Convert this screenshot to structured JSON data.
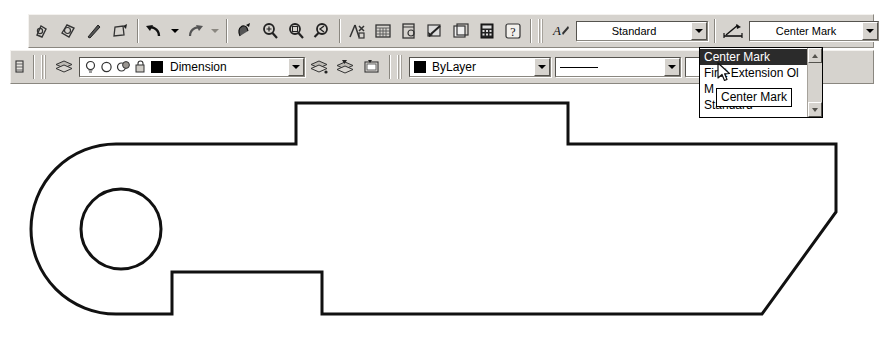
{
  "app": {
    "context": "AutoCAD drawing window with toolbars"
  },
  "toolbar_row_1": {
    "buttons": [
      {
        "name": "match-properties-icon",
        "label": "Match Properties"
      },
      {
        "name": "block-icon",
        "label": "Make Block"
      },
      {
        "name": "point-icon",
        "label": "Point"
      },
      {
        "name": "hatch-icon",
        "label": "Hatch"
      },
      {
        "name": "undo-icon",
        "label": "Undo"
      },
      {
        "name": "undo-dropdown-icon",
        "label": "Undo options"
      },
      {
        "name": "redo-icon",
        "label": "Redo"
      },
      {
        "name": "redo-dropdown-icon",
        "label": "Redo options"
      },
      {
        "name": "pan-realtime-icon",
        "label": "Pan Realtime"
      },
      {
        "name": "zoom-realtime-icon",
        "label": "Zoom Realtime"
      },
      {
        "name": "zoom-window-icon",
        "label": "Zoom Window"
      },
      {
        "name": "zoom-previous-icon",
        "label": "Zoom Previous"
      },
      {
        "name": "properties-icon",
        "label": "Properties"
      },
      {
        "name": "designcenter-icon",
        "label": "DesignCenter"
      },
      {
        "name": "tool-palettes-icon",
        "label": "Tool Palettes"
      },
      {
        "name": "sheet-set-icon",
        "label": "Sheet Set Manager"
      },
      {
        "name": "markup-set-icon",
        "label": "Markup Set Manager"
      },
      {
        "name": "calculator-icon",
        "label": "QuickCalc"
      },
      {
        "name": "help-icon",
        "label": "Help"
      }
    ],
    "text_style": {
      "icon_name": "text-style-icon",
      "value": "Standard"
    },
    "dim_style": {
      "icon_name": "dimension-style-icon",
      "value": "Center Mark"
    },
    "dim_style_manager": {
      "icon_name": "dimension-style-manager-icon",
      "label": "Dimension Style Manager"
    }
  },
  "toolbar_row_2": {
    "buttons_left": [
      {
        "name": "layer-properties-manager-icon",
        "label": "Layer Properties Manager"
      },
      {
        "name": "layer-previous-icon",
        "label": "Layer Previous"
      }
    ],
    "layer_combo": {
      "icons": [
        {
          "name": "layer-on-off-bulb-icon",
          "label": "On / Off"
        },
        {
          "name": "layer-freeze-thaw-icon",
          "label": "Freeze / Thaw"
        },
        {
          "name": "layer-freeze-viewport-icon",
          "label": "Freeze in viewport"
        },
        {
          "name": "layer-lock-unlock-icon",
          "label": "Lock / Unlock"
        },
        {
          "name": "layer-color-swatch-icon",
          "label": "Layer color"
        }
      ],
      "value": "Dimension"
    },
    "buttons_mid": [
      {
        "name": "make-object-layer-current-icon",
        "label": "Make Object's Layer Current"
      },
      {
        "name": "layer-previous-2-icon",
        "label": "Layer Previous"
      },
      {
        "name": "layer-states-icon",
        "label": "Layer States"
      }
    ],
    "color_combo": {
      "swatch_name": "color-swatch-icon",
      "value": "ByLayer"
    },
    "linetype_combo": {
      "preview_name": "linetype-preview-icon",
      "value": ""
    },
    "lineweight_combo": {
      "value": ""
    }
  },
  "dim_style_dropdown": {
    "open": true,
    "items": [
      {
        "label": "Center Mark",
        "selected": true
      },
      {
        "label": "First Extension Ol",
        "selected": false
      },
      {
        "label": "M",
        "selected": false
      },
      {
        "label": "Standard",
        "selected": false
      }
    ],
    "scroll_up_name": "scroll-up-arrow-icon",
    "scroll_down_name": "scroll-down-arrow-icon"
  },
  "tooltip": {
    "text": "Center Mark"
  },
  "cursor": {
    "name": "mouse-pointer-cursor",
    "x": 717,
    "y": 62
  },
  "drawing": {
    "title": "Mechanical part outline",
    "stroke_color": "#111111",
    "fill_color": "#ffffff",
    "outline_path": "M 116 58 L 296 58 L 296 17 L 568 17 L 568 58 L 836 58 L 836 126 L 762 228 L 322 228 L 322 186 L 172 186 L 172 228 L 116 228 A 85 85 0 0 1 116 58 Z",
    "hole": {
      "name": "bolt-hole-circle",
      "cx": 121,
      "cy": 143,
      "r": 40
    }
  }
}
